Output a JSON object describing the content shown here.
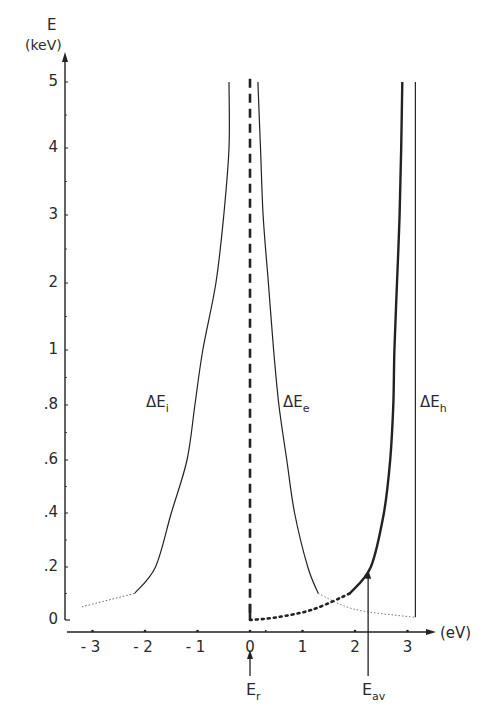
{
  "chart_data": {
    "type": "line",
    "title": "",
    "xlabel": "(eV)",
    "ylabel": "E (keV)",
    "y_axis": {
      "title": "E",
      "unit": "(keV)",
      "ticks": [
        "0",
        ".2",
        ".4",
        ".6",
        ".8",
        "1",
        "2",
        "3",
        "4",
        "5"
      ],
      "scale": "piecewise (0–1 expanded, 1–5 compressed)",
      "range": [
        0,
        5.05
      ]
    },
    "x_axis": {
      "unit": "(eV)",
      "ticks": [
        "- 3",
        "- 2",
        "- 1",
        "0",
        "1",
        "2",
        "3"
      ],
      "range": [
        -3.3,
        3.5
      ]
    },
    "grid": false,
    "series": [
      {
        "name": "ΔE_i",
        "style": "solid thin, dotted below E≈0.1 keV",
        "points": [
          [
            -3.2,
            0.05
          ],
          [
            -2.2,
            0.1
          ],
          [
            -1.8,
            0.2
          ],
          [
            -1.5,
            0.4
          ],
          [
            -1.2,
            0.6
          ],
          [
            -1.05,
            0.8
          ],
          [
            -0.9,
            1.0
          ],
          [
            -0.65,
            2.0
          ],
          [
            -0.5,
            3.0
          ],
          [
            -0.4,
            4.0
          ],
          [
            -0.4,
            5.0
          ]
        ]
      },
      {
        "name": "ΔE_e",
        "style": "solid thin, dotted below E≈0.1 keV to flat tail",
        "points": [
          [
            0.15,
            5.0
          ],
          [
            0.2,
            4.0
          ],
          [
            0.25,
            3.0
          ],
          [
            0.35,
            2.0
          ],
          [
            0.45,
            1.0
          ],
          [
            0.55,
            0.8
          ],
          [
            0.7,
            0.6
          ],
          [
            0.85,
            0.4
          ],
          [
            1.1,
            0.2
          ],
          [
            1.3,
            0.1
          ],
          [
            2.0,
            0.04
          ],
          [
            3.15,
            0.01
          ]
        ]
      },
      {
        "name": "Thick curve (from E_r)",
        "style": "thick dashed vertical at E_r=0, heavy dotted then thick solid rising",
        "points": [
          [
            0,
            5.05
          ],
          [
            0,
            0.0
          ],
          [
            0.5,
            0.01
          ],
          [
            1.2,
            0.04
          ],
          [
            1.9,
            0.1
          ],
          [
            2.3,
            0.2
          ],
          [
            2.55,
            0.4
          ],
          [
            2.67,
            0.6
          ],
          [
            2.73,
            0.8
          ],
          [
            2.75,
            1.0
          ],
          [
            2.8,
            2.0
          ],
          [
            2.85,
            3.0
          ],
          [
            2.88,
            4.0
          ],
          [
            2.9,
            5.0
          ]
        ]
      },
      {
        "name": "ΔE_h",
        "style": "solid thin vertical",
        "points": [
          [
            3.15,
            0.01
          ],
          [
            3.15,
            5.0
          ]
        ]
      }
    ],
    "annotations": [
      {
        "text": "ΔE_i",
        "x": -1.9,
        "y": 0.85
      },
      {
        "text": "ΔE_e",
        "x": 0.55,
        "y": 0.85
      },
      {
        "text": "ΔE_h",
        "x": 3.3,
        "y": 0.85
      },
      {
        "text": "E_r",
        "x": 0,
        "arrow": "up to x-axis at 0 eV"
      },
      {
        "text": "E_av",
        "x": 2.25,
        "arrow": "up to E≈0.18 keV at ≈2.25 eV"
      }
    ]
  },
  "labels": {
    "y_title": "E",
    "y_unit": "(keV)",
    "x_unit": "(eV)",
    "curve_i": {
      "main": "ΔE",
      "sub": "i"
    },
    "curve_e": {
      "main": "ΔE",
      "sub": "e"
    },
    "curve_h": {
      "main": "ΔE",
      "sub": "h"
    },
    "er": {
      "main": "E",
      "sub": "r"
    },
    "eav": {
      "main": "E",
      "sub": "av"
    }
  },
  "colors": {
    "ink": "#222222",
    "background": "#ffffff"
  }
}
